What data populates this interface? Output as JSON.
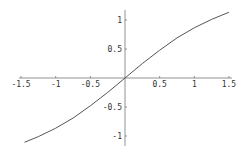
{
  "chart_data": {
    "type": "line",
    "title": "",
    "xlabel": "",
    "ylabel": "",
    "xlim": [
      -1.5,
      1.5
    ],
    "ylim": [
      -1.2,
      1.2
    ],
    "grid": false,
    "legend": null,
    "x_ticks": [
      -1.5,
      -1,
      -0.5,
      0.5,
      1,
      1.5
    ],
    "x_tick_labels": [
      "-1.5",
      "-1",
      "-0.5",
      "0.5",
      "1",
      "1.5"
    ],
    "y_ticks": [
      1,
      0.5,
      -0.5,
      -1
    ],
    "y_tick_labels": [
      "1",
      "0.5",
      "-0.5",
      "-1"
    ],
    "series": [
      {
        "name": "curve",
        "x": [
          -1.45,
          -1.25,
          -1.0,
          -0.75,
          -0.5,
          -0.25,
          0,
          0.25,
          0.5,
          0.75,
          1.0,
          1.25,
          1.5
        ],
        "y": [
          -1.109,
          -1.011,
          -0.866,
          -0.691,
          -0.48,
          -0.248,
          0,
          0.248,
          0.48,
          0.691,
          0.866,
          1.011,
          1.132
        ]
      }
    ],
    "colors": {
      "curve": "#555555",
      "axes": "#777777",
      "text": "#333333"
    }
  }
}
